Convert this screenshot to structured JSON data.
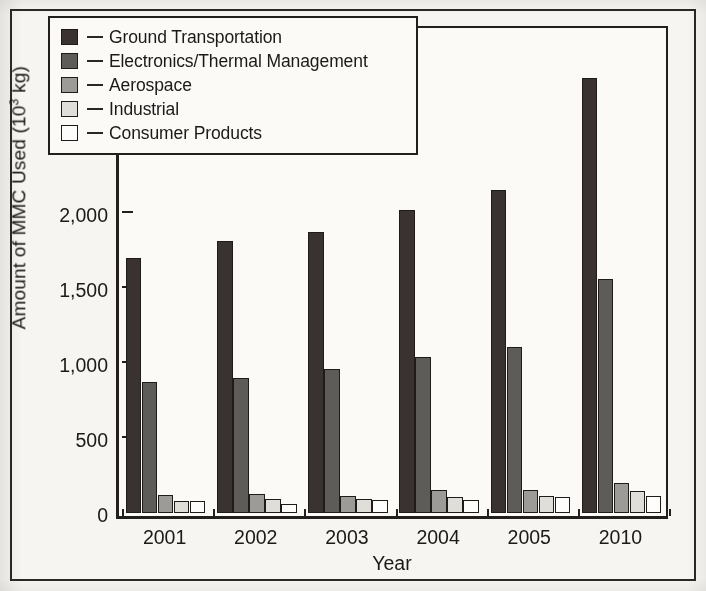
{
  "chart_data": {
    "type": "bar",
    "title": "",
    "xlabel": "Year",
    "ylabel_text": "Amount of MMC Used (10",
    "ylabel_sup": "3",
    "ylabel_tail": " kg)",
    "ylabel_full": "Amount of MMC Used (10³ kg)",
    "categories": [
      "2001",
      "2002",
      "2003",
      "2004",
      "2005",
      "2010"
    ],
    "ylim": [
      0,
      3250
    ],
    "yticks": [
      0,
      500,
      1000,
      1500,
      2000,
      2500,
      3000
    ],
    "ytick_labels": [
      "0",
      "500",
      "1,000",
      "1,500",
      "2,000",
      "2,500",
      "3,000"
    ],
    "grid": false,
    "legend_position": "upper-left-inside",
    "series": [
      {
        "name": "Ground Transportation",
        "color": "#3a3230",
        "values": [
          1700,
          1810,
          1870,
          2020,
          2150,
          2900
        ]
      },
      {
        "name": "Electronics/Thermal Management",
        "color": "#5e5c59",
        "values": [
          875,
          900,
          960,
          1040,
          1105,
          1560
        ]
      },
      {
        "name": "Aerospace",
        "color": "#9d9b97",
        "values": [
          120,
          128,
          110,
          150,
          150,
          200
        ]
      },
      {
        "name": "Industrial",
        "color": "#e0ded8",
        "values": [
          80,
          95,
          95,
          105,
          115,
          145
        ]
      },
      {
        "name": "Consumer Products",
        "color": "#fdfdfb",
        "values": [
          80,
          62,
          85,
          90,
          105,
          110
        ]
      }
    ]
  },
  "legend": {
    "dash": "—",
    "items": [
      {
        "label": "Ground Transportation",
        "color": "#3a3230"
      },
      {
        "label": "Electronics/Thermal Management",
        "color": "#5e5c59"
      },
      {
        "label": "Aerospace",
        "color": "#9d9b97"
      },
      {
        "label": "Industrial",
        "color": "#e0ded8"
      },
      {
        "label": "Consumer Products",
        "color": "#fdfdfb"
      }
    ]
  }
}
